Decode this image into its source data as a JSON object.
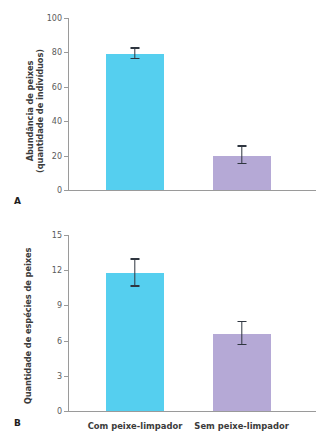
{
  "figure": {
    "panel_a_letter": "A",
    "panel_b_letter": "B",
    "bar_color_primary": "#55CFEF",
    "bar_color_secondary": "#B5A9D6",
    "error_bar_color": "#2F3640",
    "axis_color": "#9A9A9A"
  },
  "chart_data": [
    {
      "type": "bar",
      "panel": "A",
      "title": "",
      "xlabel": "",
      "ylabel": "Abundância de peixes (quantidade de indivíduos)",
      "ylabel_line1": "Abundância de peixes",
      "ylabel_line2": "(quantidade de indivíduos)",
      "categories": [
        "Com peixe-limpador",
        "Sem peixe-limpador"
      ],
      "values": [
        79,
        20
      ],
      "error_low": [
        76,
        15
      ],
      "error_high": [
        83,
        26
      ],
      "colors": [
        "#55CFEF",
        "#B5A9D6"
      ],
      "ylim": [
        0,
        100
      ],
      "yticks": [
        0,
        20,
        40,
        60,
        80,
        100
      ],
      "ytick_labels": [
        "0",
        "20",
        "40",
        "60",
        "80",
        "100"
      ],
      "grid": false,
      "legend": "none"
    },
    {
      "type": "bar",
      "panel": "B",
      "title": "",
      "xlabel": "",
      "ylabel": "Quantidade de espécies de peixes",
      "categories": [
        "Com peixe-limpador",
        "Sem peixe-limpador"
      ],
      "values": [
        11.8,
        6.6
      ],
      "error_low": [
        10.6,
        5.6
      ],
      "error_high": [
        13.0,
        7.7
      ],
      "colors": [
        "#55CFEF",
        "#B5A9D6"
      ],
      "ylim": [
        0,
        15
      ],
      "yticks": [
        0,
        3,
        6,
        9,
        12,
        15
      ],
      "ytick_labels": [
        "0",
        "3",
        "6",
        "9",
        "12",
        "15"
      ],
      "grid": false,
      "legend": "none"
    }
  ]
}
